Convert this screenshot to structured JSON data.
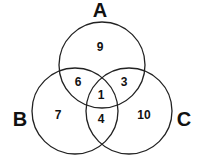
{
  "diagram": {
    "type": "venn-3",
    "sets": [
      {
        "id": "A",
        "label": "A",
        "cx": 102,
        "cy": 65,
        "r": 43
      },
      {
        "id": "B",
        "label": "B",
        "cx": 75,
        "cy": 111,
        "r": 43
      },
      {
        "id": "C",
        "label": "C",
        "cx": 129,
        "cy": 111,
        "r": 43
      }
    ],
    "regions": {
      "A_only": "9",
      "B_only": "7",
      "C_only": "10",
      "A_and_B_only": "6",
      "A_and_C_only": "3",
      "B_and_C_only": "4",
      "A_and_B_and_C": "1"
    }
  }
}
